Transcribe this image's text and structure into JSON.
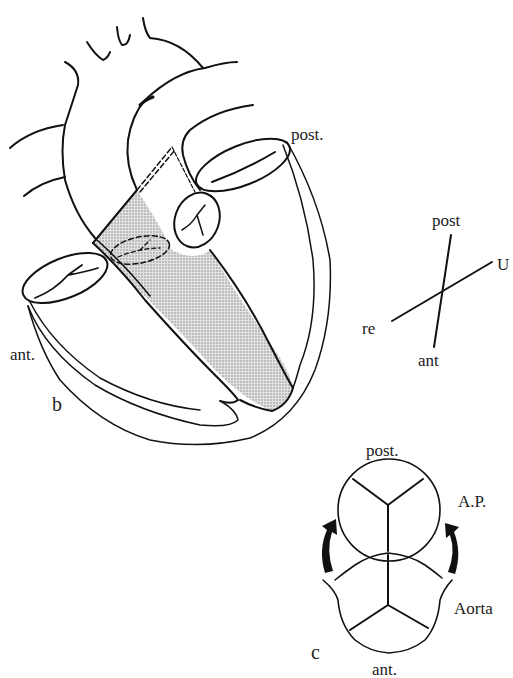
{
  "figure_b": {
    "panel_label": "b",
    "label_posterior": "post.",
    "label_anterior": "ant.",
    "shaded_region": "outflow septum (stippled)",
    "colors": {
      "line": "#111111",
      "stipple": "#b8b8b8",
      "background": "#ffffff"
    }
  },
  "orientation_axes": {
    "label_top": "post",
    "label_right": "U",
    "label_left": "re",
    "label_bottom": "ant"
  },
  "figure_c": {
    "panel_label": "c",
    "label_top": "post.",
    "label_bottom": "ant.",
    "label_upper_valve": "A.P.",
    "label_lower_valve": "Aorta"
  }
}
